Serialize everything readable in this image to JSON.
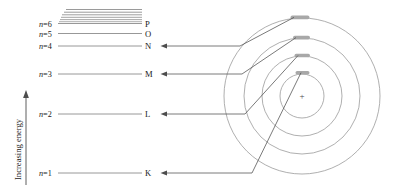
{
  "figure": {
    "type": "atomic-energy-level-and-shell-diagram",
    "axis": {
      "caption": "Increasing energy",
      "direction": "up"
    },
    "nucleus": {
      "charge_symbol": "+"
    },
    "continuum": {
      "line_count": 6,
      "description": "converging lines above n=6"
    },
    "levels": [
      {
        "n_label": "n",
        "eq": "=",
        "n_value": "6",
        "shell": "P",
        "line_y": 23.5,
        "orbit_index": null
      },
      {
        "n_label": "n",
        "eq": "=",
        "n_value": "5",
        "shell": "O",
        "line_y": 33.5,
        "orbit_index": null
      },
      {
        "n_label": "n",
        "eq": "=",
        "n_value": "4",
        "shell": "N",
        "line_y": 46.0,
        "orbit_index": 3
      },
      {
        "n_label": "n",
        "eq": "=",
        "n_value": "3",
        "shell": "M",
        "line_y": 74.0,
        "orbit_index": 2
      },
      {
        "n_label": "n",
        "eq": "=",
        "n_value": "2",
        "shell": "L",
        "line_y": 114.0,
        "orbit_index": 1
      },
      {
        "n_label": "n",
        "eq": "=",
        "n_value": "1",
        "shell": "K",
        "line_y": 173.0,
        "orbit_index": 0
      }
    ],
    "orbits": [
      {
        "shell": "K",
        "radius": 22,
        "electron_angle_deg": -75
      },
      {
        "shell": "L",
        "radius": 40,
        "electron_angle_deg": -80
      },
      {
        "shell": "M",
        "radius": 58,
        "electron_angle_deg": -84
      },
      {
        "shell": "N",
        "radius": 78,
        "electron_angle_deg": -87
      }
    ],
    "colors": {
      "level_line": "#8c8c8c",
      "orbit_stroke": "#9a9a9a",
      "connector": "#4d4d4d",
      "electron_marker": "#a8a8a8",
      "text": "#1a1a1a",
      "background": "#ffffff"
    }
  }
}
